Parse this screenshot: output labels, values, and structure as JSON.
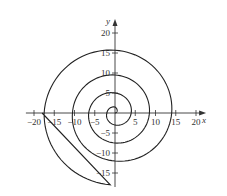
{
  "chart_data": {
    "type": "line",
    "title": "",
    "xlabel": "x",
    "ylabel": "y",
    "xlim": [
      -22,
      22
    ],
    "ylim": [
      -17,
      23
    ],
    "x_ticks": [
      -20,
      -15,
      -10,
      -5,
      5,
      10,
      15,
      20
    ],
    "y_ticks": [
      20,
      15,
      10,
      5,
      -5,
      -10,
      -15
    ],
    "x_tick_labels": [
      "-20",
      "-15",
      "-10",
      "-5",
      "5",
      "10",
      "15",
      "20"
    ],
    "y_tick_labels": [
      "20",
      "15",
      "10",
      "5",
      "-5",
      "-10",
      "-15"
    ],
    "grid": false,
    "series": [
      {
        "name": "spiral",
        "description": "Spiral curve starting at origin, winding counterclockwise outward, ending at about (-18, 0)",
        "points": [
          [
            0,
            0
          ],
          [
            1.5,
            0
          ],
          [
            0,
            2
          ],
          [
            -3,
            0
          ],
          [
            0,
            -4
          ],
          [
            5,
            0
          ],
          [
            0,
            6.5
          ],
          [
            -7.5,
            0
          ],
          [
            0,
            -8.5
          ],
          [
            9.5,
            0
          ],
          [
            0,
            10.5
          ],
          [
            -12,
            0
          ],
          [
            0,
            -14
          ],
          [
            15.7,
            0
          ],
          [
            0,
            17.5
          ],
          [
            -18,
            0
          ]
        ]
      }
    ]
  }
}
